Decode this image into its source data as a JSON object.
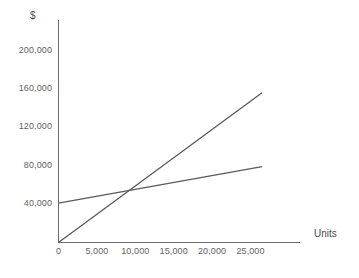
{
  "chart_data": {
    "type": "line",
    "title": "",
    "subtitle": "",
    "xlabel": "Units",
    "ylabel": "$",
    "xlim": [
      0,
      26500
    ],
    "ylim": [
      0,
      225000
    ],
    "grid": false,
    "legend": "none",
    "x_ticks": [
      {
        "value": 0,
        "label": "0"
      },
      {
        "value": 5000,
        "label": "5,000"
      },
      {
        "value": 10000,
        "label": "10,000"
      },
      {
        "value": 15000,
        "label": "15,000"
      },
      {
        "value": 20000,
        "label": "20,000"
      },
      {
        "value": 25000,
        "label": "25,000"
      }
    ],
    "y_ticks": [
      {
        "value": 40000,
        "label": "40,000"
      },
      {
        "value": 80000,
        "label": "80,000"
      },
      {
        "value": 120000,
        "label": "120,000"
      },
      {
        "value": 160000,
        "label": "160,000"
      },
      {
        "value": 200000,
        "label": "200,000"
      }
    ],
    "series": [
      {
        "name": "total-cost-line",
        "color": "#5a5a5a",
        "x": [
          0,
          26500
        ],
        "values": [
          41000,
          79000
        ]
      },
      {
        "name": "revenue-line",
        "color": "#5a5a5a",
        "x": [
          0,
          26500
        ],
        "values": [
          0,
          156000
        ]
      }
    ],
    "annotations": [
      {
        "name": "breakeven-intersection",
        "x": 11500,
        "y": 57000,
        "label": ""
      }
    ]
  },
  "axes": {
    "y_axis_label": "$",
    "x_axis_label": "Units"
  }
}
